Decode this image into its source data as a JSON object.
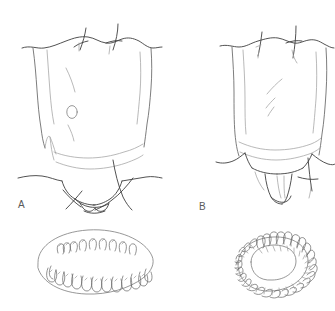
{
  "plate": {
    "background_color": "#ffffff",
    "ink_color": "#555555",
    "ink_color_dark": "#3a3a3a",
    "ink_color_light": "#9a9a9a",
    "width": 335,
    "height": 311,
    "medium": "pen-and-ink scientific line drawing",
    "subject": "two terminal abdominal segments of an arthropod with associated hooked ring structures"
  },
  "labels": {
    "a": "A",
    "b": "B"
  },
  "panels": [
    {
      "id": "A",
      "label": "A",
      "label_position": {
        "x": 18,
        "y": 200
      },
      "body": {
        "name": "terminal-segment-a",
        "description": "trapezoidal segment with wavy anterior margin, two crossing setae at top, small circular pore at center-left, transverse folds near base, bilobed terminal appendage with crossed setae"
      },
      "detail": {
        "name": "hook-plate-oval",
        "shape": "oval",
        "center": {
          "x": 95,
          "y": 262
        },
        "rx": 57,
        "ry": 33,
        "rows": 2,
        "upper_row_hooks": 9,
        "lower_row_hooks": 13,
        "hook_shape": "J-shaped recurved spine"
      }
    },
    {
      "id": "B",
      "label": "B",
      "label_position": {
        "x": 199,
        "y": 202
      },
      "body": {
        "name": "terminal-segment-b",
        "description": "trapezoidal segment with wavy anterior margin, two crossing setae at top, two short oblique dashes at center, transverse fold near base, single tongue-shaped terminal lobe with crossed seta"
      },
      "detail": {
        "name": "hook-ring-annulus",
        "shape": "ring",
        "center": {
          "x": 272,
          "y": 264
        },
        "rx": 48,
        "ry": 33,
        "hook_count": 32,
        "hook_shape": "radially arranged recurved spine"
      }
    }
  ]
}
